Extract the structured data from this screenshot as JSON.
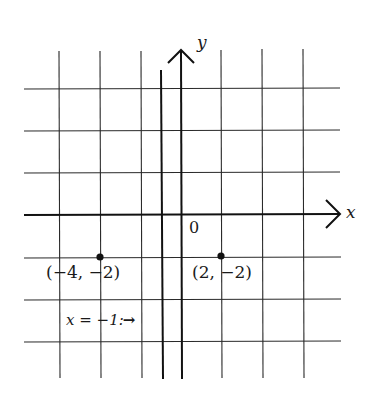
{
  "diagram": {
    "type": "coordinate_plane",
    "grid_unit_per_line": 2,
    "axes": {
      "x_label": "x",
      "y_label": "y",
      "origin_label": "0"
    },
    "vertical_line": {
      "equation": "x = −1",
      "label": "x = −1:",
      "arrow": "→"
    },
    "points": [
      {
        "x": -4,
        "y": -2,
        "label": "(−4, −2)"
      },
      {
        "x": 2,
        "y": -2,
        "label": "(2, −2)"
      }
    ]
  },
  "colors": {
    "ink": "#1a1a1a",
    "grid": "#2a2a2a",
    "background": "#ffffff"
  }
}
